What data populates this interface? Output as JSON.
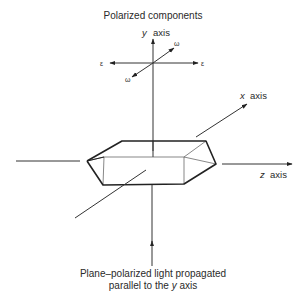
{
  "figure": {
    "title": "Polarized components",
    "caption_line1": "Plane–polarized light propagated",
    "caption_line2_prefix": "parallel to the",
    "caption_line2_var": "y",
    "caption_line2_suffix": "axis"
  },
  "axes": {
    "y": {
      "var": "y",
      "word": "axis"
    },
    "x": {
      "var": "x",
      "word": "axis"
    },
    "z": {
      "var": "z",
      "word": "axis"
    }
  },
  "components": {
    "epsilon_symbol": "ε",
    "omega_symbol": "ω"
  }
}
